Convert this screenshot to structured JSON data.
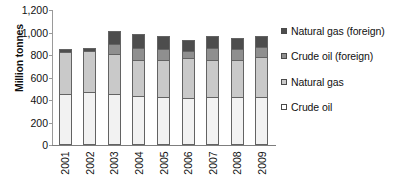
{
  "chart_data": {
    "type": "bar",
    "subtype": "stacked-column",
    "title": "",
    "xlabel": "",
    "ylabel": "Million tonnes",
    "ylim": [
      0,
      1200
    ],
    "ytick_step": 200,
    "ytick_labels": [
      "1,200",
      "1,000",
      "800",
      "600",
      "400",
      "200",
      "0"
    ],
    "ytick_values": [
      1200,
      1000,
      800,
      600,
      400,
      200,
      0
    ],
    "grid": false,
    "legend_position": "right",
    "categories": [
      "2001",
      "2002",
      "2003",
      "2004",
      "2005",
      "2006",
      "2007",
      "2008",
      "2009"
    ],
    "series": [
      {
        "name": "Crude oil",
        "color": "#f2f2f2",
        "values": [
          455,
          470,
          450,
          440,
          425,
          415,
          425,
          425,
          425
        ]
      },
      {
        "name": "Natural gas",
        "color": "#c9c9c9",
        "values": [
          375,
          365,
          355,
          315,
          330,
          355,
          330,
          330,
          355
        ]
      },
      {
        "name": "Crude oil (foreign)",
        "color": "#8f8f8f",
        "values": [
          0,
          0,
          95,
          105,
          100,
          65,
          105,
          100,
          95
        ]
      },
      {
        "name": "Natural gas (foreign)",
        "color": "#4d4d4d",
        "values": [
          25,
          25,
          115,
          125,
          115,
          95,
          105,
          100,
          90
        ]
      }
    ],
    "totals": [
      855,
      860,
      1015,
      985,
      970,
      930,
      965,
      955,
      965
    ],
    "legend_entries": [
      {
        "label": "Natural gas (foreign)",
        "color": "#4d4d4d"
      },
      {
        "label": "Crude oil (foreign)",
        "color": "#8f8f8f"
      },
      {
        "label": "Natural gas",
        "color": "#c9c9c9"
      },
      {
        "label": "Crude oil",
        "color": "#ffffff"
      }
    ]
  }
}
